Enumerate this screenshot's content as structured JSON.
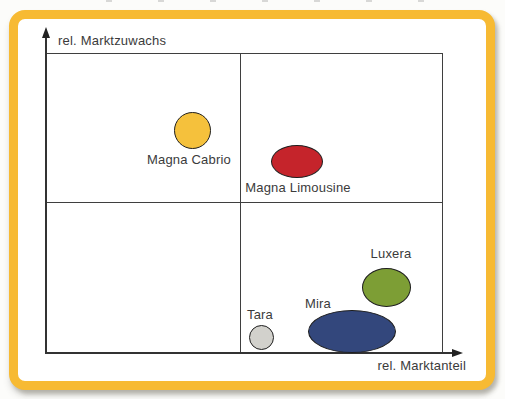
{
  "figure": {
    "frame_color": "#F7BA33",
    "background_color": "#FFFFFF",
    "line_color": "#3A3A3A",
    "text_color": "#3B3B3B"
  },
  "chart_data": {
    "type": "scatter",
    "subtype": "portfolio-matrix-2x2",
    "title": "",
    "xlabel": "rel. Marktanteil",
    "ylabel": "rel. Marktzuwachs",
    "grid": "2x2 quadrant dividers",
    "legend": "none",
    "axis_ticks": "none (qualitative axes with arrowheads)",
    "points": [
      {
        "label": "Magna Cabrio",
        "x_frac": 0.37,
        "y_frac": 0.74,
        "quadrant": "upper-left",
        "color": "#F5C13C",
        "cx": 192,
        "cy": 130,
        "rx": 18.5,
        "ry": 18.5,
        "label_cx": 189,
        "label_top": 152
      },
      {
        "label": "Magna Limousine",
        "x_frac": 0.63,
        "y_frac": 0.64,
        "quadrant": "upper-right",
        "color": "#C5242B",
        "cx": 297,
        "cy": 161,
        "rx": 26,
        "ry": 16.5,
        "label_cx": 298,
        "label_top": 180
      },
      {
        "label": "Luxera",
        "x_frac": 0.86,
        "y_frac": 0.22,
        "quadrant": "lower-right",
        "color": "#7D9E35",
        "cx": 386,
        "cy": 287,
        "rx": 24.5,
        "ry": 19.5,
        "label_cx": 391,
        "label_top": 246
      },
      {
        "label": "Mira",
        "x_frac": 0.77,
        "y_frac": 0.07,
        "quadrant": "lower-right",
        "color": "#33477C",
        "cx": 352,
        "cy": 331,
        "rx": 44,
        "ry": 21.5,
        "label_cx": 318,
        "label_top": 296
      },
      {
        "label": "Tara",
        "x_frac": 0.54,
        "y_frac": 0.05,
        "quadrant": "lower-right",
        "color": "#D2D1CC",
        "cx": 261,
        "cy": 337,
        "rx": 12.5,
        "ry": 12.5,
        "label_cx": 260,
        "label_top": 307
      }
    ]
  }
}
